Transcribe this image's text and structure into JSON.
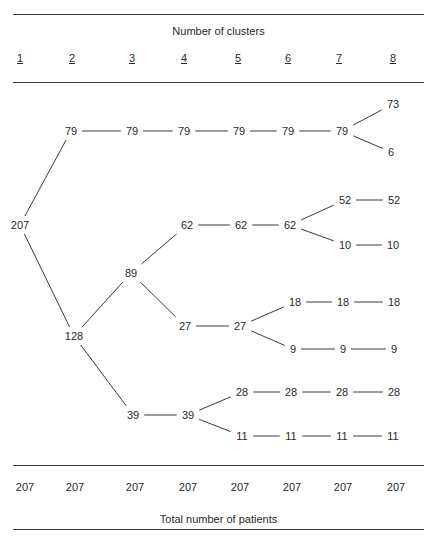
{
  "header": {
    "title": "Number of clusters",
    "columns": [
      "1",
      "2",
      "3",
      "4",
      "5",
      "6",
      "7",
      "8"
    ]
  },
  "footer": {
    "totals": [
      "207",
      "207",
      "207",
      "207",
      "207",
      "207",
      "207",
      "207"
    ],
    "caption": "Total number of patients"
  },
  "tree": {
    "nodes": [
      {
        "id": "c1_207",
        "col": 1,
        "value": "207",
        "x": 20,
        "y": 225
      },
      {
        "id": "c2_79",
        "col": 2,
        "value": "79",
        "x": 71,
        "y": 131
      },
      {
        "id": "c2_128",
        "col": 2,
        "value": "128",
        "x": 74,
        "y": 336
      },
      {
        "id": "c3_79",
        "col": 3,
        "value": "79",
        "x": 132,
        "y": 131
      },
      {
        "id": "c3_89",
        "col": 3,
        "value": "89",
        "x": 131,
        "y": 273
      },
      {
        "id": "c3_39",
        "col": 3,
        "value": "39",
        "x": 133,
        "y": 415
      },
      {
        "id": "c4_79",
        "col": 4,
        "value": "79",
        "x": 184,
        "y": 131
      },
      {
        "id": "c4_62",
        "col": 4,
        "value": "62",
        "x": 187,
        "y": 225
      },
      {
        "id": "c4_27",
        "col": 4,
        "value": "27",
        "x": 185,
        "y": 326
      },
      {
        "id": "c4_39",
        "col": 4,
        "value": "39",
        "x": 188,
        "y": 415
      },
      {
        "id": "c5_79",
        "col": 5,
        "value": "79",
        "x": 239,
        "y": 131
      },
      {
        "id": "c5_62",
        "col": 5,
        "value": "62",
        "x": 241,
        "y": 225
      },
      {
        "id": "c5_27",
        "col": 5,
        "value": "27",
        "x": 240,
        "y": 326
      },
      {
        "id": "c5_28",
        "col": 5,
        "value": "28",
        "x": 242,
        "y": 392
      },
      {
        "id": "c5_11",
        "col": 5,
        "value": "11",
        "x": 242,
        "y": 436
      },
      {
        "id": "c6_79",
        "col": 6,
        "value": "79",
        "x": 288,
        "y": 131
      },
      {
        "id": "c6_62",
        "col": 6,
        "value": "62",
        "x": 290,
        "y": 225
      },
      {
        "id": "c6_18",
        "col": 6,
        "value": "18",
        "x": 295,
        "y": 302
      },
      {
        "id": "c6_9",
        "col": 6,
        "value": "9",
        "x": 293,
        "y": 349
      },
      {
        "id": "c6_28",
        "col": 6,
        "value": "28",
        "x": 291,
        "y": 392
      },
      {
        "id": "c6_11",
        "col": 6,
        "value": "11",
        "x": 291,
        "y": 436
      },
      {
        "id": "c7_79",
        "col": 7,
        "value": "79",
        "x": 342,
        "y": 131
      },
      {
        "id": "c7_52",
        "col": 7,
        "value": "52",
        "x": 345,
        "y": 200
      },
      {
        "id": "c7_10",
        "col": 7,
        "value": "10",
        "x": 345,
        "y": 245
      },
      {
        "id": "c7_18",
        "col": 7,
        "value": "18",
        "x": 343,
        "y": 302
      },
      {
        "id": "c7_9",
        "col": 7,
        "value": "9",
        "x": 343,
        "y": 349
      },
      {
        "id": "c7_28",
        "col": 7,
        "value": "28",
        "x": 342,
        "y": 392
      },
      {
        "id": "c7_11",
        "col": 7,
        "value": "11",
        "x": 342,
        "y": 436
      },
      {
        "id": "c8_73",
        "col": 8,
        "value": "73",
        "x": 393,
        "y": 104
      },
      {
        "id": "c8_6",
        "col": 8,
        "value": "6",
        "x": 391,
        "y": 152
      },
      {
        "id": "c8_52",
        "col": 8,
        "value": "52",
        "x": 394,
        "y": 200
      },
      {
        "id": "c8_10",
        "col": 8,
        "value": "10",
        "x": 393,
        "y": 245
      },
      {
        "id": "c8_18",
        "col": 8,
        "value": "18",
        "x": 394,
        "y": 302
      },
      {
        "id": "c8_9",
        "col": 8,
        "value": "9",
        "x": 394,
        "y": 349
      },
      {
        "id": "c8_28",
        "col": 8,
        "value": "28",
        "x": 394,
        "y": 392
      },
      {
        "id": "c8_11",
        "col": 8,
        "value": "11",
        "x": 393,
        "y": 436
      }
    ],
    "edges": [
      [
        "c1_207",
        "c2_79"
      ],
      [
        "c1_207",
        "c2_128"
      ],
      [
        "c2_79",
        "c3_79"
      ],
      [
        "c2_128",
        "c3_89"
      ],
      [
        "c2_128",
        "c3_39"
      ],
      [
        "c3_79",
        "c4_79"
      ],
      [
        "c3_89",
        "c4_62"
      ],
      [
        "c3_89",
        "c4_27"
      ],
      [
        "c3_39",
        "c4_39"
      ],
      [
        "c4_79",
        "c5_79"
      ],
      [
        "c4_62",
        "c5_62"
      ],
      [
        "c4_27",
        "c5_27"
      ],
      [
        "c4_39",
        "c5_28"
      ],
      [
        "c4_39",
        "c5_11"
      ],
      [
        "c5_79",
        "c6_79"
      ],
      [
        "c5_62",
        "c6_62"
      ],
      [
        "c5_27",
        "c6_18"
      ],
      [
        "c5_27",
        "c6_9"
      ],
      [
        "c5_28",
        "c6_28"
      ],
      [
        "c5_11",
        "c6_11"
      ],
      [
        "c6_79",
        "c7_79"
      ],
      [
        "c6_62",
        "c7_52"
      ],
      [
        "c6_62",
        "c7_10"
      ],
      [
        "c6_18",
        "c7_18"
      ],
      [
        "c6_9",
        "c7_9"
      ],
      [
        "c6_28",
        "c7_28"
      ],
      [
        "c6_11",
        "c7_11"
      ],
      [
        "c7_79",
        "c8_73"
      ],
      [
        "c7_79",
        "c8_6"
      ],
      [
        "c7_52",
        "c8_52"
      ],
      [
        "c7_10",
        "c8_10"
      ],
      [
        "c7_18",
        "c8_18"
      ],
      [
        "c7_9",
        "c8_9"
      ],
      [
        "c7_28",
        "c8_28"
      ],
      [
        "c7_11",
        "c8_11"
      ]
    ]
  }
}
